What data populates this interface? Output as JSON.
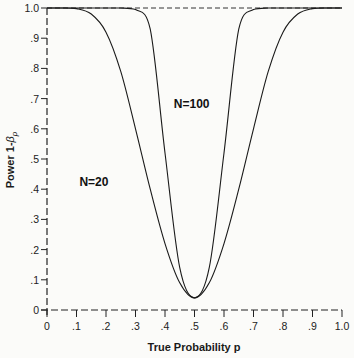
{
  "chart_data": {
    "type": "line",
    "title": "",
    "xlabel": "True Probability p",
    "ylabel": "Power 1-β_p",
    "ylabel_main": "Power 1-",
    "ylabel_beta": "β",
    "ylabel_sub": "p",
    "xlim": [
      0,
      1.0
    ],
    "ylim": [
      0,
      1.0
    ],
    "grid": false,
    "legend": "inline labels",
    "x_ticks": [
      "0",
      ".1",
      ".2",
      ".3",
      ".4",
      ".5",
      ".6",
      ".7",
      ".8",
      ".9",
      "1.0"
    ],
    "y_ticks": [
      "0",
      ".1",
      ".2",
      ".3",
      ".4",
      ".5",
      ".6",
      ".7",
      ".8",
      ".9",
      "1.0"
    ],
    "reference_line": {
      "y": 1.0,
      "style": "dashed"
    },
    "x": [
      0.0,
      0.05,
      0.1,
      0.15,
      0.2,
      0.25,
      0.3,
      0.35,
      0.4,
      0.45,
      0.5,
      0.55,
      0.6,
      0.65,
      0.7,
      0.75,
      0.8,
      0.85,
      0.9,
      0.95,
      1.0
    ],
    "series": [
      {
        "name": "N=20",
        "label": "N=20",
        "values": [
          1.0,
          1.0,
          0.998,
          0.98,
          0.92,
          0.79,
          0.6,
          0.4,
          0.22,
          0.09,
          0.04,
          0.09,
          0.22,
          0.4,
          0.6,
          0.79,
          0.92,
          0.98,
          0.998,
          1.0,
          1.0
        ]
      },
      {
        "name": "N=100",
        "label": "N=100",
        "values": [
          1.0,
          1.0,
          1.0,
          1.0,
          1.0,
          1.0,
          0.995,
          0.93,
          0.52,
          0.14,
          0.04,
          0.14,
          0.52,
          0.93,
          0.995,
          1.0,
          1.0,
          1.0,
          1.0,
          1.0,
          1.0
        ]
      }
    ],
    "annotations": [
      {
        "text": "N=100",
        "x": 0.43,
        "y": 0.67
      },
      {
        "text": "N=20",
        "x": 0.11,
        "y": 0.41
      }
    ]
  }
}
